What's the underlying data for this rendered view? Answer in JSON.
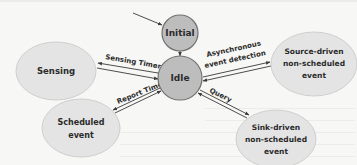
{
  "diagram": {
    "type": "state-diagram",
    "colors": {
      "background": "#f7f7f5",
      "state_fill": "#bdbdbd",
      "activity_fill": "#e4e4e4",
      "line": "#3a3a3a",
      "text": "#2b2b2b"
    },
    "nodes": {
      "initial": {
        "label": "Initial"
      },
      "idle": {
        "label": "Idle"
      },
      "sensing": {
        "label": "Sensing"
      },
      "scheduled": {
        "line1": "Scheduled",
        "line2": "event"
      },
      "source": {
        "line1": "Source-driven",
        "line2": "non-scheduled",
        "line3": "event"
      },
      "sink": {
        "line1": "Sink-driven",
        "line2": "non-scheduled",
        "line3": "event"
      }
    },
    "edges": {
      "sensing_timer": {
        "label": "Sensing Timer"
      },
      "async": {
        "line1": "Asynchronous",
        "line2": "event detection"
      },
      "report_timer": {
        "label": "Report Timer"
      },
      "query": {
        "label": "Query"
      }
    }
  }
}
